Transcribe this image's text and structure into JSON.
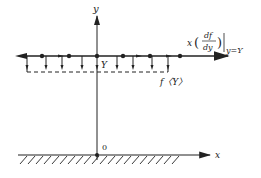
{
  "diagram": {
    "labels": {
      "y_axis": "y",
      "x_axis": "x",
      "origin": "0",
      "level": "Y",
      "function_label": "f〈Y〉",
      "upper_expr_prefix": "x",
      "upper_expr_num": "df",
      "upper_expr_den": "dy",
      "upper_expr_eval": "y=Y"
    },
    "upper_line": {
      "dots_x": [
        42,
        69,
        97,
        123,
        150,
        180
      ],
      "down_arrows_x": [
        27,
        46,
        62,
        82,
        97,
        117,
        133,
        152,
        168
      ]
    },
    "colors": {
      "stroke": "#222222",
      "background": "#ffffff"
    }
  }
}
